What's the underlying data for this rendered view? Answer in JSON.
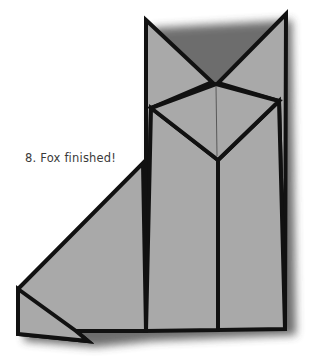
{
  "diagram": {
    "step_caption": "8. Fox finished!",
    "colors": {
      "paper_fill": "#a9a9a9",
      "outline": "#111111",
      "shadow": "#3c3c3c",
      "background": "#ffffff",
      "caption_text": "#3a3a3a"
    },
    "parts": [
      "left-ear",
      "right-ear",
      "head-diamond",
      "body-left-panel",
      "body-right-panel",
      "tail",
      "tail-tip-fold"
    ]
  }
}
